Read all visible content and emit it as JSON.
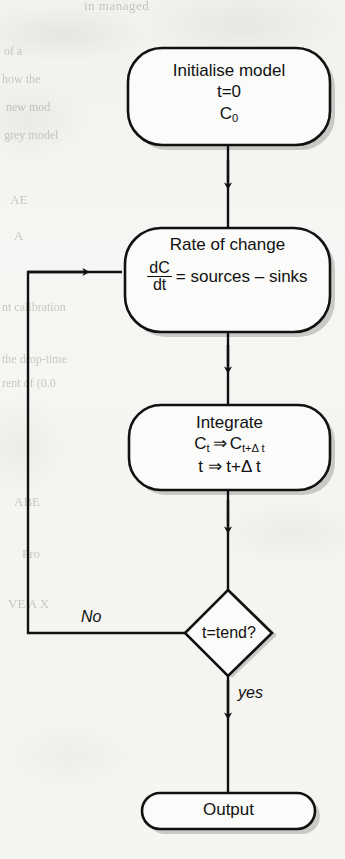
{
  "diagram": {
    "type": "flowchart",
    "background_color": "#f6f5f3",
    "stroke_color": "#111111",
    "shadow_color": "#9b9a96",
    "nodes": [
      {
        "id": "initialise",
        "shape": "rounded-rectangle",
        "lines": [
          "Initialise model",
          "t=0",
          "C0"
        ],
        "line1": "Initialise model",
        "line2": "t=0",
        "line3_base": "C",
        "line3_sub": "0"
      },
      {
        "id": "rate-of-change",
        "shape": "rounded-rectangle",
        "title": "Rate of change",
        "numerator": "dC",
        "denominator": "dt",
        "equation_rhs": "= sources – sinks"
      },
      {
        "id": "integrate",
        "shape": "rounded-rectangle",
        "title": "Integrate",
        "line2_a": "C",
        "line2_a_sub": "t",
        "line2_arrow": "⇒",
        "line2_b": "C",
        "line2_b_sub": "t+Δ t",
        "line3": "t ⇒ t+Δ t"
      },
      {
        "id": "decision",
        "shape": "diamond",
        "label": "t=tend?"
      },
      {
        "id": "output",
        "shape": "rounded-rectangle",
        "label": "Output"
      }
    ],
    "edges": [
      {
        "id": "initialise-to-rate",
        "from": "initialise",
        "to": "rate-of-change",
        "label": ""
      },
      {
        "id": "rate-to-integrate",
        "from": "rate-of-change",
        "to": "integrate",
        "label": ""
      },
      {
        "id": "integrate-to-decision",
        "from": "integrate",
        "to": "decision",
        "label": ""
      },
      {
        "id": "decision-no-loop",
        "from": "decision",
        "to": "rate-of-change",
        "label": "No"
      },
      {
        "id": "decision-yes-output",
        "from": "decision",
        "to": "output",
        "label": "yes"
      }
    ],
    "edge_labels": {
      "no": "No",
      "yes": "yes"
    }
  },
  "bleed_through": {
    "lines": [
      "in managed",
      "of a",
      "how the",
      "new mod",
      "grey model",
      "AE",
      "A",
      "nt calibration",
      "the drop-time",
      "rent of (0.0",
      "ABE",
      "Pro",
      "VE A X"
    ]
  }
}
